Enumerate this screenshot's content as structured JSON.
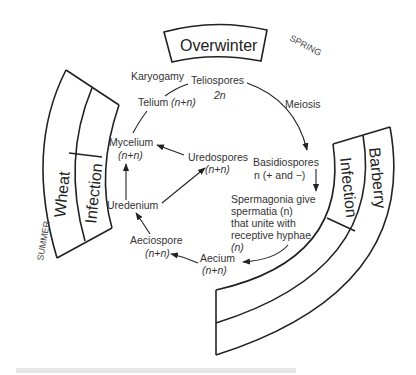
{
  "diagram": {
    "boxes": {
      "overwinter": "Overwinter",
      "wheat": "Wheat",
      "wheat_infection": "Infection",
      "barberry": "Barberry",
      "barberry_infection": "Infection"
    },
    "seasons": {
      "spring": "SPRING",
      "summer": "SUMMER"
    },
    "stages": {
      "karyogamy": "Karyogamy",
      "teliospores": "Teliospores",
      "teliospores_ploidy": "2n",
      "meiosis": "Meiosis",
      "telium": "Telium",
      "telium_ploidy": "(n+n)",
      "mycelium": "Mycelium",
      "mycelium_ploidy": "(n+n)",
      "uredospores": "Uredospores",
      "uredospores_ploidy": "(n+n)",
      "basidiospores": "Basidiospores",
      "basidiospores_ploidy": "n (+ and −)",
      "uredenium": "Uredenium",
      "spermagonia_line1": "Spermagonia give",
      "spermagonia_line2": "spermatia (n)",
      "spermagonia_line3": "that unite with",
      "spermagonia_line4": "receptive hyphae",
      "spermagonia_line5": "(n)",
      "aeciospore": "Aeciospore",
      "aeciospore_ploidy": "(n+n)",
      "aecium": "Aecium",
      "aecium_ploidy": "(n+n)"
    },
    "edges": [
      {
        "from": "Teliospores",
        "to": "Basidiospores",
        "label": "Meiosis"
      },
      {
        "from": "Basidiospores",
        "to": "Spermagonia"
      },
      {
        "from": "Spermagonia",
        "to": "Aecium"
      },
      {
        "from": "Aecium",
        "to": "Aeciospore"
      },
      {
        "from": "Aeciospore",
        "to": "Uredenium"
      },
      {
        "from": "Uredenium",
        "to": "Mycelium"
      },
      {
        "from": "Uredenium",
        "to": "Uredospores"
      },
      {
        "from": "Uredospores",
        "to": "Mycelium"
      },
      {
        "from": "Mycelium",
        "to": "Telium"
      },
      {
        "from": "Telium",
        "to": "Teliospores",
        "label": "Karyogamy"
      }
    ]
  }
}
